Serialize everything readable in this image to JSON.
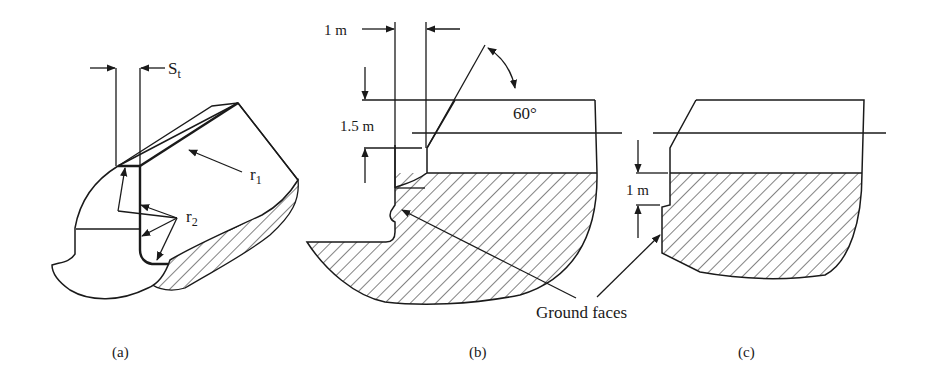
{
  "figure": {
    "panels": [
      {
        "id": "a",
        "caption": "(a)",
        "labels": {
          "chip_width": "S",
          "chip_width_sub": "t",
          "radius1": "r",
          "radius1_sub": "1",
          "radius2": "r",
          "radius2_sub": "2"
        }
      },
      {
        "id": "b",
        "caption": "(b)",
        "labels": {
          "width_dim": "1 m",
          "height_dim": "1.5 m",
          "angle": "60°"
        }
      },
      {
        "id": "c",
        "caption": "(c)",
        "labels": {
          "height_dim": "1 m"
        }
      }
    ],
    "shared_annotation": "Ground faces",
    "colors": {
      "line": "#1a1a1a",
      "background": "#ffffff"
    }
  }
}
